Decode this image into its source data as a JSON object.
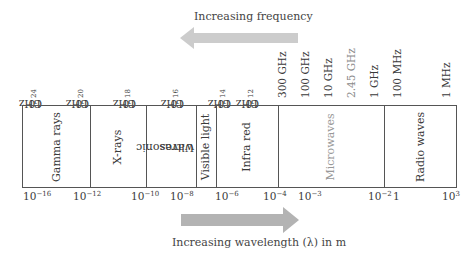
{
  "top_arrow": {
    "label": "Increasing frequency",
    "direction": "left",
    "color": "#cccccc"
  },
  "bottom_arrow": {
    "label": "Increasing wavelength (λ) in m",
    "direction": "right",
    "color": "#b3b3b3"
  },
  "frequency_labels": [
    {
      "base": "10",
      "exp": "24",
      "unit": " GHz"
    },
    {
      "base": "10",
      "exp": "20",
      "unit": " GHz"
    },
    {
      "base": "10",
      "exp": "18",
      "unit": " GHz"
    },
    {
      "base": "10",
      "exp": "16",
      "unit": " GHz"
    },
    {
      "base": "10",
      "exp": "14",
      "unit": " GHz"
    },
    {
      "base": "10",
      "exp": "12",
      "unit": " GHz"
    },
    {
      "base": "300 GHz",
      "exp": "",
      "unit": ""
    },
    {
      "base": "100 GHz",
      "exp": "",
      "unit": ""
    },
    {
      "base": "10 GHz",
      "exp": "",
      "unit": ""
    },
    {
      "base": "2.45 GHz",
      "exp": "",
      "unit": ""
    },
    {
      "base": "1 GHz",
      "exp": "",
      "unit": ""
    },
    {
      "base": "100 MHz",
      "exp": "",
      "unit": ""
    },
    {
      "base": "1 MHz",
      "exp": "",
      "unit": ""
    }
  ],
  "bands": [
    {
      "label": "Gamma rays"
    },
    {
      "label": "X-rays"
    },
    {
      "label": "Ultrasonic waves",
      "line1": "Ultrasonic",
      "line2": "waves"
    },
    {
      "label": "Visible light"
    },
    {
      "label": "Infra red"
    },
    {
      "label": "Microwaves",
      "color": "#999999"
    },
    {
      "label": "Radio waves"
    }
  ],
  "wavelength_labels": [
    {
      "base": "10",
      "exp": "−16"
    },
    {
      "base": "10",
      "exp": "−12"
    },
    {
      "base": "10",
      "exp": "−10"
    },
    {
      "base": "10",
      "exp": "−8"
    },
    {
      "base": "10",
      "exp": "−6"
    },
    {
      "base": "10",
      "exp": "−4"
    },
    {
      "base": "10",
      "exp": "−3"
    },
    {
      "base": "10",
      "exp": "−2"
    },
    {
      "base": "1",
      "exp": ""
    },
    {
      "base": "10",
      "exp": "3"
    }
  ]
}
